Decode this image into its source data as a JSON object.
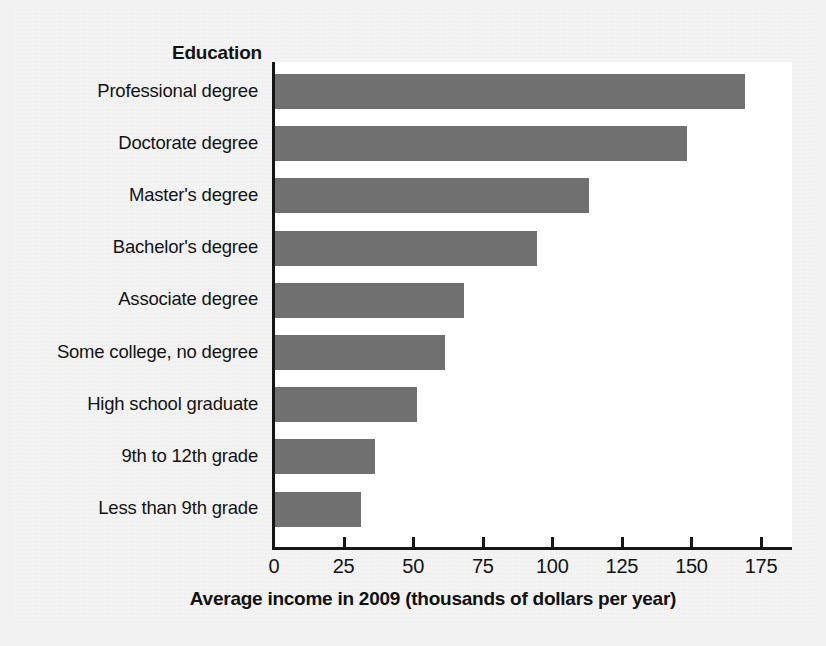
{
  "figure": {
    "category_axis_title": "Education",
    "x_axis_title": "Average income in 2009 (thousands of dollars per year)",
    "bar_color": "#707070",
    "background_color": "#f4f4f4",
    "plot_background_color": "#ffffff",
    "axis_color": "#151515"
  },
  "chart_data": {
    "type": "bar",
    "orientation": "horizontal",
    "title": "",
    "subtitle": "",
    "xlabel": "Average income in 2009 (thousands of dollars per year)",
    "ylabel": "Education",
    "categories": [
      "Professional degree",
      "Doctorate degree",
      "Master's degree",
      "Bachelor's degree",
      "Associate degree",
      "Some college, no degree",
      "High school graduate",
      "9th to 12th grade",
      "Less than 9th grade"
    ],
    "values": [
      169,
      148,
      113,
      94,
      68,
      61,
      51,
      36,
      31
    ],
    "xlim": [
      0,
      180
    ],
    "xticks": [
      0,
      25,
      50,
      75,
      100,
      125,
      150,
      175
    ],
    "xtick_labels": [
      "0",
      "25",
      "50",
      "75",
      "100",
      "125",
      "150",
      "175"
    ],
    "grid": false,
    "legend": null,
    "units": "thousands of dollars per year",
    "year": 2009
  }
}
